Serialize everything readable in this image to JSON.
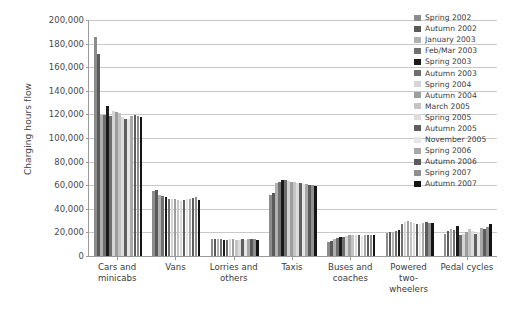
{
  "chart_data": {
    "type": "bar",
    "title": "",
    "xlabel": "",
    "ylabel": "Charging hours flow",
    "ylim": [
      0,
      200000
    ],
    "ytick_labels": [
      "200,000",
      "180,000",
      "160,000",
      "140,000",
      "120,000",
      "100,000",
      "80,000",
      "60,000",
      "40,000",
      "20,000",
      "0"
    ],
    "ytick_values": [
      200000,
      180000,
      160000,
      140000,
      120000,
      100000,
      80000,
      60000,
      40000,
      20000,
      0
    ],
    "grid": "horizontal",
    "legend_position": "right",
    "categories": [
      "Cars and minicabs",
      "Vans",
      "Lorries and others",
      "Taxis",
      "Buses and coaches",
      "Powered two-wheelers",
      "Pedal cycles"
    ],
    "series": [
      {
        "name": "Spring 2002",
        "color": "#8c8c8c",
        "values": [
          186000,
          55000,
          14500,
          52000,
          12200,
          19500,
          19000
        ]
      },
      {
        "name": "Autumn 2002",
        "color": "#5a5a5a",
        "values": [
          171000,
          56000,
          14800,
          53500,
          12500,
          20000,
          21500
        ]
      },
      {
        "name": "January 2003",
        "color": "#b0b0b0",
        "values": [
          119500,
          52000,
          14000,
          62000,
          14500,
          20500,
          22500
        ]
      },
      {
        "name": "Feb/Mar 2003",
        "color": "#707070",
        "values": [
          119500,
          50500,
          14000,
          62500,
          15500,
          21000,
          22000
        ]
      },
      {
        "name": "Spring 2003",
        "color": "#1a1a1a",
        "values": [
          127000,
          50000,
          13800,
          64500,
          15800,
          22000,
          25500
        ]
      },
      {
        "name": "Autumn 2003",
        "color": "#6e6e6e",
        "values": [
          119000,
          48500,
          13500,
          64000,
          16200,
          27500,
          17500
        ]
      },
      {
        "name": "Spring 2004",
        "color": "#d5d5d5",
        "values": [
          122500,
          48000,
          14200,
          63500,
          17000,
          29000,
          18500
        ]
      },
      {
        "name": "Autumn 2004",
        "color": "#9e9e9e",
        "values": [
          122000,
          48000,
          14000,
          63000,
          17500,
          29500,
          20500
        ]
      },
      {
        "name": "March 2005",
        "color": "#c4c4c4",
        "values": [
          121500,
          47500,
          13500,
          62500,
          17800,
          28500,
          22500
        ]
      },
      {
        "name": "Spring 2005",
        "color": "#dcdcdc",
        "values": [
          117500,
          47000,
          13200,
          62000,
          18000,
          28000,
          21500
        ]
      },
      {
        "name": "Autumn 2005",
        "color": "#5f5f5f",
        "values": [
          116500,
          47500,
          14000,
          61500,
          17500,
          27500,
          19000
        ]
      },
      {
        "name": "November 2005",
        "color": "#e6e6e6",
        "values": [
          116500,
          48000,
          13800,
          61000,
          17200,
          27000,
          20000
        ]
      },
      {
        "name": "Spring 2006",
        "color": "#a8a8a8",
        "values": [
          118500,
          48500,
          14000,
          61000,
          17500,
          28000,
          23500
        ]
      },
      {
        "name": "Autumn 2006",
        "color": "#5c5c5c",
        "values": [
          119500,
          49500,
          14200,
          60500,
          17800,
          28500,
          23000
        ]
      },
      {
        "name": "Spring 2007",
        "color": "#8f8f8f",
        "values": [
          119000,
          50000,
          14000,
          60000,
          18000,
          28000,
          24500
        ]
      },
      {
        "name": "Autumn 2007",
        "color": "#141414",
        "values": [
          117500,
          47500,
          13500,
          59500,
          18200,
          28000,
          27000
        ]
      }
    ]
  }
}
